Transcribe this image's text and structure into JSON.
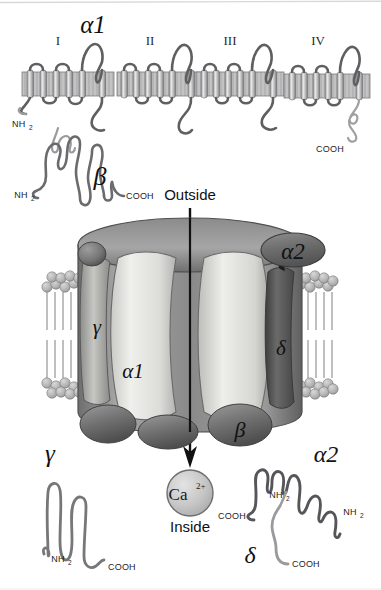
{
  "figure": {
    "title_alpha1_top": "α1",
    "domains": [
      "I",
      "II",
      "III",
      "IV"
    ],
    "terminals": {
      "nh2": "NH",
      "nh2_sub": "2",
      "cooh": "COOH"
    },
    "orientation": {
      "outside": "Outside",
      "inside": "Inside"
    },
    "ion": {
      "element": "Ca",
      "charge": "2+"
    },
    "subunits": {
      "alpha1": "α1",
      "alpha2": "α2",
      "beta": "β",
      "gamma": "γ",
      "delta": "δ"
    },
    "topology_alpha1": {
      "label": "α1",
      "nh2_label": "NH",
      "nh2_sub": "2",
      "cooh_label": "COOH",
      "segments_per_domain": 6
    },
    "topology_beta": {
      "label": "β",
      "nh2_label": "NH",
      "nh2_sub": "2",
      "cooh_label": "COOH"
    },
    "topology_gamma": {
      "label": "γ",
      "nh2_label": "NH",
      "nh2_sub": "2",
      "cooh_label": "COOH"
    },
    "topology_alpha2_delta": {
      "alpha2_label": "α2",
      "delta_label": "δ",
      "alpha2_cooh": "COOH",
      "alpha2_nh2": "NH",
      "alpha2_nh2_sub": "2",
      "delta_nh2": "NH",
      "delta_nh2_sub": "2",
      "delta_cooh": "COOH"
    },
    "complex_labels": {
      "alpha1": "α1",
      "alpha2": "α2",
      "beta": "β",
      "gamma": "γ",
      "delta": "δ"
    },
    "colors": {
      "background": "#ffffff",
      "ink": "#1a1a1a",
      "chain_outline": "#58585a",
      "chain_dark": "#4a4a4d",
      "chain_light": "#9a9a9e",
      "membrane_band": "#c9c9cb",
      "membrane_stripe": "#8d8d90",
      "protein_light": "#e8e8e6",
      "protein_mid": "#a9a9a9",
      "protein_dark": "#6d6d6d",
      "lipid_head": "#b5b5b5",
      "ion_fill": "#c4c4c4"
    }
  }
}
